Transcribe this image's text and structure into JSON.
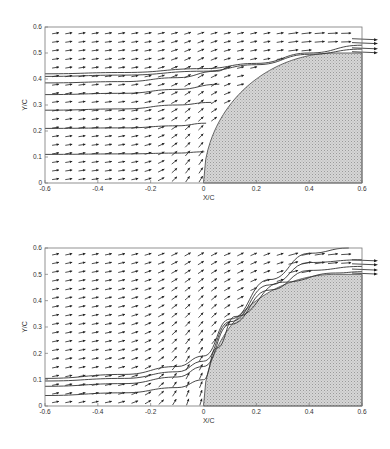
{
  "chart_data": [
    {
      "type": "quiver",
      "title": "",
      "xlabel": "X/C",
      "ylabel": "Y/C",
      "xlim": [
        -0.6,
        0.6
      ],
      "ylim": [
        0,
        0.6
      ],
      "xticks": [
        -0.6,
        -0.4,
        -0.2,
        0,
        0.2,
        0.4,
        0.6
      ],
      "xtick_labels": [
        "-0.6",
        "-0.4",
        "-0.2",
        "0",
        "0.2",
        "0.4",
        "0.6"
      ],
      "yticks": [
        0,
        0.1,
        0.2,
        0.3,
        0.4,
        0.5,
        0.6
      ],
      "ytick_labels": [
        "0",
        "0.1",
        "0.2",
        "0.3",
        "0.4",
        "0.5",
        "0.6"
      ],
      "grid": false,
      "body": {
        "description": "shaded elliptical leading-edge body",
        "x_start": 0,
        "x_top": 0.5,
        "y_top": 0.5,
        "x_end": 0.6
      },
      "streamlines": [
        {
          "y_start": 0.42,
          "points": [
            [
              -0.6,
              0.42
            ],
            [
              -0.3,
              0.425
            ],
            [
              0,
              0.44
            ],
            [
              0.2,
              0.46
            ],
            [
              0.4,
              0.5
            ],
            [
              0.6,
              0.53
            ]
          ]
        },
        {
          "y_start": 0.41,
          "points": [
            [
              -0.6,
              0.41
            ],
            [
              -0.3,
              0.415
            ],
            [
              0,
              0.43
            ],
            [
              0.2,
              0.455
            ],
            [
              0.4,
              0.495
            ],
            [
              0.6,
              0.515
            ]
          ]
        },
        {
          "y_start": 0.385,
          "points": [
            [
              -0.6,
              0.385
            ],
            [
              -0.3,
              0.39
            ],
            [
              -0.1,
              0.405
            ],
            [
              0.05,
              0.43
            ],
            [
              0.1,
              0.445
            ]
          ]
        },
        {
          "y_start": 0.34,
          "points": [
            [
              -0.6,
              0.34
            ],
            [
              -0.3,
              0.345
            ],
            [
              -0.1,
              0.36
            ],
            [
              0.06,
              0.38
            ]
          ]
        },
        {
          "y_start": 0.28,
          "points": [
            [
              -0.6,
              0.28
            ],
            [
              -0.3,
              0.285
            ],
            [
              -0.1,
              0.3
            ],
            [
              0.03,
              0.31
            ]
          ]
        },
        {
          "y_start": 0.21,
          "points": [
            [
              -0.6,
              0.21
            ],
            [
              -0.3,
              0.212
            ],
            [
              -0.1,
              0.22
            ],
            [
              0.01,
              0.23
            ]
          ]
        },
        {
          "y_start": 0.11,
          "points": [
            [
              -0.6,
              0.11
            ],
            [
              -0.3,
              0.112
            ],
            [
              -0.1,
              0.115
            ],
            [
              0.003,
              0.12
            ]
          ]
        }
      ],
      "upper_exit_streamlines_y": [
        0.555,
        0.54,
        0.52,
        0.505
      ]
    },
    {
      "type": "quiver",
      "title": "",
      "xlabel": "X/C",
      "ylabel": "Y/C",
      "xlim": [
        -0.6,
        0.6
      ],
      "ylim": [
        0,
        0.6
      ],
      "xticks": [
        -0.6,
        -0.4,
        -0.2,
        0,
        0.2,
        0.4,
        0.6
      ],
      "xtick_labels": [
        "-0.6",
        "-0.4",
        "-0.2",
        "0",
        "0.2",
        "0.4",
        "0.6"
      ],
      "yticks": [
        0,
        0.1,
        0.2,
        0.3,
        0.4,
        0.5,
        0.6
      ],
      "ytick_labels": [
        "0",
        "0.1",
        "0.2",
        "0.3",
        "0.4",
        "0.5",
        "0.6"
      ],
      "grid": false,
      "body": {
        "description": "shaded elliptical leading-edge body",
        "x_start": 0,
        "x_top": 0.5,
        "y_top": 0.5,
        "x_end": 0.6
      },
      "streamlines": [
        {
          "y_start": 0.105,
          "points": [
            [
              -0.6,
              0.105
            ],
            [
              -0.3,
              0.12
            ],
            [
              -0.1,
              0.15
            ],
            [
              0.0,
              0.19
            ],
            [
              0.1,
              0.33
            ],
            [
              0.25,
              0.48
            ],
            [
              0.4,
              0.58
            ],
            [
              0.55,
              0.6
            ]
          ]
        },
        {
          "y_start": 0.095,
          "points": [
            [
              -0.6,
              0.095
            ],
            [
              -0.3,
              0.105
            ],
            [
              -0.1,
              0.13
            ],
            [
              0.0,
              0.17
            ],
            [
              0.1,
              0.32
            ],
            [
              0.25,
              0.46
            ],
            [
              0.4,
              0.545
            ],
            [
              0.6,
              0.555
            ]
          ]
        },
        {
          "y_start": 0.075,
          "points": [
            [
              -0.6,
              0.075
            ],
            [
              -0.3,
              0.085
            ],
            [
              -0.1,
              0.11
            ],
            [
              0.0,
              0.15
            ],
            [
              0.1,
              0.31
            ],
            [
              0.25,
              0.44
            ],
            [
              0.4,
              0.515
            ],
            [
              0.6,
              0.53
            ]
          ]
        },
        {
          "y_start": 0.04,
          "points": [
            [
              -0.6,
              0.04
            ],
            [
              -0.3,
              0.05
            ],
            [
              -0.1,
              0.07
            ],
            [
              0.0,
              0.1
            ],
            [
              0.05,
              0.22
            ],
            [
              0.12,
              0.34
            ],
            [
              0.3,
              0.47
            ],
            [
              0.5,
              0.505
            ],
            [
              0.6,
              0.51
            ]
          ]
        }
      ],
      "upper_exit_streamlines_y": [
        0.555,
        0.54,
        0.52,
        0.505
      ]
    }
  ],
  "figure": {
    "panels": [
      {
        "id": "top",
        "frame": {
          "left": 45,
          "right": 362,
          "top": 27,
          "bottom": 183
        }
      },
      {
        "id": "bottom",
        "frame": {
          "left": 45,
          "right": 362,
          "top": 248,
          "bottom": 406
        }
      }
    ]
  }
}
